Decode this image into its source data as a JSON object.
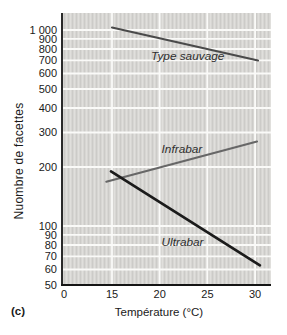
{
  "figure": {
    "panel_label": "(c)",
    "x_axis_title": "Température (°C)",
    "y_axis_title": "Nuombre de facettes"
  },
  "chart_data": {
    "type": "line",
    "title": "",
    "xlabel": "Température (°C)",
    "ylabel": "Nuombre de facettes",
    "x_scale": "linear, compressed between 0 and 15",
    "y_scale": "log",
    "xlim": [
      0,
      31.7
    ],
    "ylim": [
      50,
      1000
    ],
    "grid": {
      "show": true,
      "color": "#fafaf8"
    },
    "x_ticks": [
      {
        "v": 0,
        "label": "0"
      },
      {
        "v": 15,
        "label": "15"
      },
      {
        "v": 20,
        "label": "20"
      },
      {
        "v": 25,
        "label": "25"
      },
      {
        "v": 30,
        "label": "30"
      }
    ],
    "y_ticks": [
      {
        "v": 50,
        "label": "50"
      },
      {
        "v": 60,
        "label": "60"
      },
      {
        "v": 70,
        "label": "70"
      },
      {
        "v": 80,
        "label": "80"
      },
      {
        "v": 90,
        "label": "90"
      },
      {
        "v": 100,
        "label": "100"
      },
      {
        "v": 200,
        "label": "200"
      },
      {
        "v": 300,
        "label": "300"
      },
      {
        "v": 400,
        "label": "400"
      },
      {
        "v": 500,
        "label": "500"
      },
      {
        "v": 600,
        "label": "600"
      },
      {
        "v": 700,
        "label": "700"
      },
      {
        "v": 800,
        "label": "800"
      },
      {
        "v": 900,
        "label": "900"
      },
      {
        "v": 1000,
        "label": "1 000"
      }
    ],
    "series": [
      {
        "name": "Type sauvage",
        "color": "#4a4a4a",
        "width": 2.1,
        "points": [
          [
            15,
            1030
          ],
          [
            30.3,
            700
          ]
        ],
        "label": {
          "x": 19.1,
          "y": 700
        }
      },
      {
        "name": "Infrabar",
        "color": "#676767",
        "width": 2.1,
        "points": [
          [
            14.4,
            168
          ],
          [
            30.2,
            270
          ]
        ],
        "label": {
          "x": 20.2,
          "y": 236
        }
      },
      {
        "name": "Ultrabar",
        "color": "#1b1b1b",
        "width": 2.7,
        "points": [
          [
            14.9,
            190
          ],
          [
            30.5,
            63
          ]
        ],
        "label": {
          "x": 20.2,
          "y": 79
        }
      }
    ],
    "colors": {
      "plot_bg": "#d7d6d3",
      "plot_bg_stripe_dark": "#cccbc8",
      "plot_bg_stripe_light": "#e0dfdc",
      "axis": "#151515",
      "text": "#1a1a1a",
      "series_label_text": "#2e2e2e"
    },
    "px": {
      "left": 62,
      "top": 13,
      "right": 271,
      "bottom": 285,
      "decade": 196,
      "x15": 112,
      "xunit": 9.54
    }
  }
}
